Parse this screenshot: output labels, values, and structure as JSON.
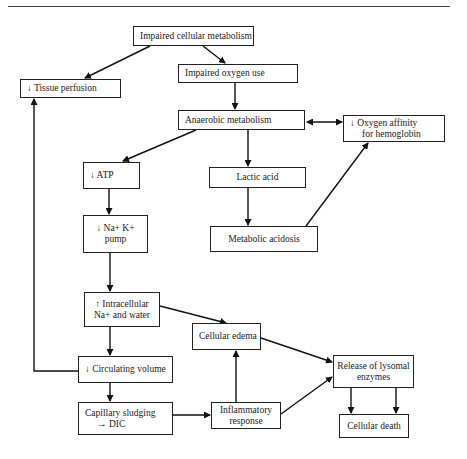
{
  "diagram": {
    "nodes": {
      "impaired_cellular_metabolism": {
        "line1": "Impaired cellular metabolism"
      },
      "impaired_oxygen_use": {
        "line1": "Impaired oxygen use"
      },
      "tissue_perfusion": {
        "line1": "↓ Tissue perfusion"
      },
      "anaerobic_metabolism": {
        "line1": "Anaerobic metabolism"
      },
      "oxygen_affinity": {
        "line1": "↓ Oxygen affinity",
        "line2": "for hemoglobin"
      },
      "atp": {
        "line1": "↓ ATP"
      },
      "lactic_acid": {
        "line1": "Lactic acid"
      },
      "na_k_pump": {
        "line1": "↓ Na+ K+",
        "line2": "pump"
      },
      "metabolic_acidosis": {
        "line1": "Metabolic acidosis"
      },
      "intracellular_na_water": {
        "line1": "↑ Intracellular",
        "line2": "Na+ and water"
      },
      "cellular_edema": {
        "line1": "Cellular edema"
      },
      "circulating_volume": {
        "line1": "↓ Circulating volume"
      },
      "release_lysosomal_enzymes": {
        "line1": "Release of lysomal",
        "line2": "enzymes"
      },
      "capillary_sludging": {
        "line1": "Capillary sludging",
        "line2": "→ DIC"
      },
      "inflammatory_response": {
        "line1": "Inflammatory",
        "line2": "response"
      },
      "cellular_death": {
        "line1": "Cellular death"
      }
    },
    "edges": [
      {
        "from": "impaired_cellular_metabolism",
        "to": "tissue_perfusion"
      },
      {
        "from": "impaired_cellular_metabolism",
        "to": "impaired_oxygen_use"
      },
      {
        "from": "impaired_oxygen_use",
        "to": "anaerobic_metabolism"
      },
      {
        "from": "anaerobic_metabolism",
        "to": "oxygen_affinity",
        "bidirectional": true
      },
      {
        "from": "anaerobic_metabolism",
        "to": "atp"
      },
      {
        "from": "anaerobic_metabolism",
        "to": "lactic_acid"
      },
      {
        "from": "lactic_acid",
        "to": "metabolic_acidosis"
      },
      {
        "from": "metabolic_acidosis",
        "to": "oxygen_affinity"
      },
      {
        "from": "atp",
        "to": "na_k_pump"
      },
      {
        "from": "na_k_pump",
        "to": "intracellular_na_water"
      },
      {
        "from": "intracellular_na_water",
        "to": "cellular_edema"
      },
      {
        "from": "intracellular_na_water",
        "to": "circulating_volume"
      },
      {
        "from": "circulating_volume",
        "to": "tissue_perfusion"
      },
      {
        "from": "circulating_volume",
        "to": "capillary_sludging"
      },
      {
        "from": "capillary_sludging",
        "to": "inflammatory_response"
      },
      {
        "from": "inflammatory_response",
        "to": "cellular_edema"
      },
      {
        "from": "inflammatory_response",
        "to": "release_lysosomal_enzymes"
      },
      {
        "from": "cellular_edema",
        "to": "release_lysosomal_enzymes"
      },
      {
        "from": "release_lysosomal_enzymes",
        "to": "cellular_death"
      },
      {
        "from": "release_lysosomal_enzymes",
        "to": "cellular_death"
      }
    ]
  }
}
